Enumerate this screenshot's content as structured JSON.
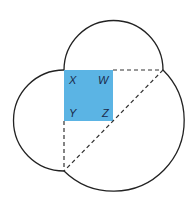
{
  "diagram": {
    "labels": {
      "x": "X",
      "w": "W",
      "y": "Y",
      "z": "Z"
    },
    "colors": {
      "square": "#5bb4e4",
      "stroke": "#222222",
      "dash": "#333333"
    }
  }
}
